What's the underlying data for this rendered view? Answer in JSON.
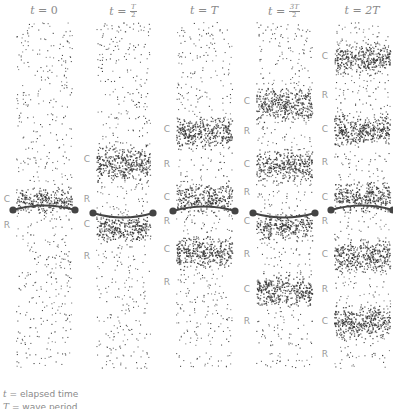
{
  "diagram": {
    "columns": [
      {
        "id": "t0",
        "title_prefix": "t = ",
        "title_value": "0",
        "title_fraction": null,
        "x": 16,
        "width": 56,
        "membrane": {
          "y": 210,
          "curve": "up"
        },
        "labels": [
          {
            "text": "C",
            "y": 200
          },
          {
            "text": "R",
            "y": 226
          }
        ],
        "dense_bands": [
          [
            190,
            210
          ]
        ]
      },
      {
        "id": "t_half",
        "title_prefix": "t = ",
        "title_value": null,
        "title_fraction": {
          "num": "T",
          "den": "2"
        },
        "x": 96,
        "width": 54,
        "membrane": {
          "y": 213,
          "curve": "down"
        },
        "labels": [
          {
            "text": "C",
            "y": 160
          },
          {
            "text": "R",
            "y": 200
          },
          {
            "text": "C",
            "y": 225
          },
          {
            "text": "R",
            "y": 257
          }
        ],
        "dense_bands": [
          [
            148,
            178
          ],
          [
            216,
            240
          ]
        ]
      },
      {
        "id": "tT",
        "title_prefix": "t = ",
        "title_value": "T",
        "title_fraction": null,
        "x": 176,
        "width": 56,
        "membrane": {
          "y": 211,
          "curve": "up"
        },
        "labels": [
          {
            "text": "C",
            "y": 130
          },
          {
            "text": "R",
            "y": 165
          },
          {
            "text": "C",
            "y": 198
          },
          {
            "text": "R",
            "y": 222
          },
          {
            "text": "C",
            "y": 250
          },
          {
            "text": "R",
            "y": 283
          }
        ],
        "dense_bands": [
          [
            118,
            146
          ],
          [
            186,
            210
          ],
          [
            238,
            266
          ]
        ]
      },
      {
        "id": "t3half",
        "title_prefix": "t = ",
        "title_value": null,
        "title_fraction": {
          "num": "3T",
          "den": "2"
        },
        "x": 256,
        "width": 56,
        "membrane": {
          "y": 213,
          "curve": "down"
        },
        "labels": [
          {
            "text": "C",
            "y": 102
          },
          {
            "text": "R",
            "y": 132
          },
          {
            "text": "C",
            "y": 165
          },
          {
            "text": "R",
            "y": 193
          },
          {
            "text": "C",
            "y": 222
          },
          {
            "text": "R",
            "y": 255
          },
          {
            "text": "C",
            "y": 290
          },
          {
            "text": "R",
            "y": 322
          }
        ],
        "dense_bands": [
          [
            90,
            118
          ],
          [
            152,
            178
          ],
          [
            216,
            238
          ],
          [
            276,
            304
          ]
        ]
      },
      {
        "id": "t2T",
        "title_prefix": "t = ",
        "title_value": "2T",
        "title_fraction": null,
        "x": 334,
        "width": 56,
        "membrane": {
          "y": 210,
          "curve": "up"
        },
        "labels": [
          {
            "text": "C",
            "y": 57
          },
          {
            "text": "R",
            "y": 96
          },
          {
            "text": "C",
            "y": 130
          },
          {
            "text": "R",
            "y": 163
          },
          {
            "text": "C",
            "y": 198
          },
          {
            "text": "R",
            "y": 222
          },
          {
            "text": "C",
            "y": 255
          },
          {
            "text": "R",
            "y": 290
          },
          {
            "text": "C",
            "y": 322
          },
          {
            "text": "R",
            "y": 355
          }
        ],
        "dense_bands": [
          [
            45,
            72
          ],
          [
            116,
            144
          ],
          [
            184,
            210
          ],
          [
            242,
            270
          ],
          [
            308,
            336
          ]
        ]
      }
    ],
    "caption": {
      "line1_symbol": "t",
      "line1_text": " = elapsed time",
      "line2_symbol": "T",
      "line2_text": " = wave period"
    },
    "colors": {
      "dots": "#333333",
      "membrane": "#444444",
      "labels": "#9a9a9a"
    }
  }
}
